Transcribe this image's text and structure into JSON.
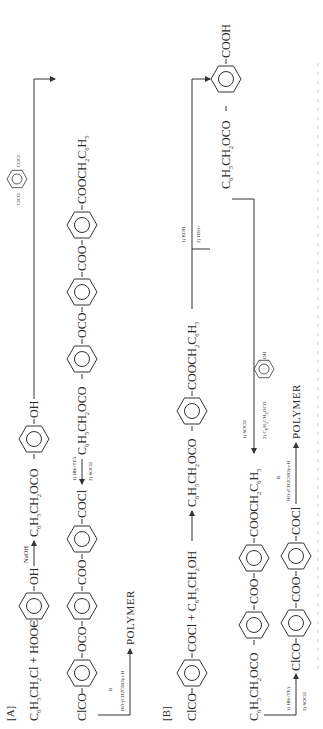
{
  "scheme": {
    "orientation": "rotated 90 degrees counter-clockwise",
    "part_a": {
      "label": "[A]",
      "row1": {
        "reactant1": "C6H5CH2Cl + HOOC",
        "reactant2_sub": "OH",
        "reagent": "NaOH",
        "product_left": "C6H5CH2OCO",
        "product_right": "OH"
      },
      "side_reagent": {
        "left": "ClCO",
        "right": "COCl"
      },
      "row2": {
        "left": "C6H5CH2OCO",
        "link1": "OCO",
        "link2": "COO",
        "right": "COOCH2C6H5"
      },
      "row3": {
        "left": "ClCO",
        "link1": "OCO",
        "link2": "COO",
        "right": "COCl",
        "reagents": [
          "1) HBr/TFA",
          "2) SOCl2"
        ]
      },
      "polymer_reagent": "HO-(CH2CHO)n-H",
      "polymer_reagent_r": "R",
      "polymer_label": "POLYMER"
    },
    "part_b": {
      "label": "[B]",
      "row1": {
        "left": "ClCO",
        "right": "COCl + C6H5CH2OH",
        "product_left": "C6H5CH2OCO",
        "product_right": "COOCH2C6H5"
      },
      "hydrolysis_reagents": [
        "1) KOH",
        "2) H3O+"
      ],
      "acid_product": {
        "left": "C6H5CH2OCO",
        "right": "COOH"
      },
      "coupling_reagents": [
        "1) SOCl2",
        "2) C6H5CH2OCO-C6H4-OH"
      ],
      "coupling_sub_left": "C6H5CH2OCO",
      "coupling_sub_right": "OH",
      "row2": {
        "left": "C6H5CH2OCO",
        "link": "COO",
        "right": "COOCH2C6H5"
      },
      "row3": {
        "left": "ClCO",
        "link": "COO",
        "right": "COCl",
        "reagents": [
          "1) HBr/TFA",
          "2) SOCl2"
        ]
      },
      "polymer_reagent": "HO-(CH2CHO)n-H",
      "polymer_reagent_r": "R",
      "polymer_label": "POLYMER"
    }
  }
}
